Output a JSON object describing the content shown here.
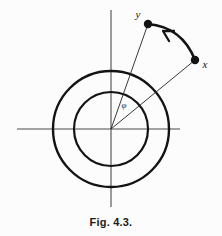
{
  "figure": {
    "caption": "Fig. 4.3.",
    "background_color": "#fdfcfc",
    "ink_color": "#131313",
    "axis_color": "#4a4a4a"
  },
  "diagram_data": {
    "type": "diagram",
    "description": "Two concentric circles centered on the origin of a pair of cartesian axes; points x and y lie outside the outer circle, joined by a thick curved arrow directed from x to y, with thin radii drawn from the origin to each point and the angle phi marked between them.",
    "canvas": {
      "width": 222,
      "height": 236
    },
    "origin": {
      "x": 111,
      "y": 129
    },
    "circles": [
      {
        "name": "inner-circle",
        "radius": 37,
        "stroke_width": 2.2
      },
      {
        "name": "outer-circle",
        "radius": 58,
        "stroke_width": 2.4
      }
    ],
    "axes": {
      "horizontal": {
        "x1": 17,
        "y1": 129,
        "x2": 180,
        "y2": 129
      },
      "vertical": {
        "x1": 111,
        "y1": 10,
        "x2": 111,
        "y2": 207
      },
      "stroke_width": 1.1
    },
    "points": [
      {
        "label": "y",
        "x": 148,
        "y": 24,
        "radius": 4.2,
        "label_x": 138,
        "label_y": 18
      },
      {
        "label": "x",
        "x": 195,
        "y": 60,
        "radius": 4.2,
        "label_x": 203,
        "label_y": 67
      }
    ],
    "radii": [
      {
        "name": "radius-to-y",
        "from": [
          111,
          129
        ],
        "to": [
          148,
          24
        ],
        "stroke_width": 0.9
      },
      {
        "name": "radius-to-x",
        "from": [
          111,
          129
        ],
        "to": [
          195,
          60
        ],
        "stroke_width": 0.9
      }
    ],
    "arc_arrow": {
      "name": "arc-from-x-to-y",
      "from": [
        195,
        60
      ],
      "to": [
        148,
        24
      ],
      "control": [
        182,
        27
      ],
      "direction": "from x to y",
      "stroke_width": 2.6,
      "arrowhead_at": [
        170,
        33
      ]
    },
    "angle_label": {
      "text": "φ",
      "x": 124,
      "y": 108
    }
  }
}
